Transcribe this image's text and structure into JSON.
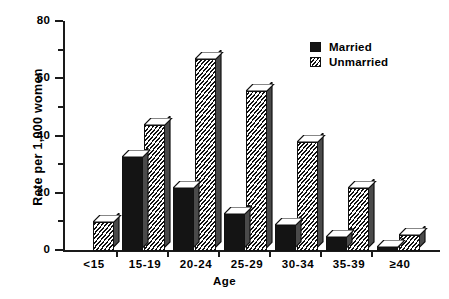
{
  "chart_data": {
    "type": "bar",
    "title": "",
    "xlabel": "Age",
    "ylabel": "Rate per 1,000 women",
    "categories": [
      "<15",
      "15-19",
      "20-24",
      "25-29",
      "30-34",
      "35-39",
      "≥40"
    ],
    "series": [
      {
        "name": "Married",
        "values": [
          0,
          33,
          22,
          13,
          9,
          5,
          1.5
        ]
      },
      {
        "name": "Unmarried",
        "values": [
          10,
          44,
          67,
          56,
          38,
          22,
          5.5
        ]
      }
    ],
    "ylim": [
      0,
      80
    ],
    "yticks": [
      0,
      20,
      40,
      60,
      80
    ],
    "ytick_labels": [
      "0",
      "20",
      "40",
      "60",
      "80"
    ],
    "yminor_ticks": [
      10,
      30,
      50,
      70
    ],
    "grid": false,
    "legend_position": "top-right",
    "style": "3d-bar",
    "colors": {
      "married": "#141414",
      "unmarried": "#ffffff",
      "axis": "#1a1a1a",
      "background": "#ffffff"
    }
  },
  "legend": {
    "entries": [
      {
        "label": "Married"
      },
      {
        "label": "Unmarried"
      }
    ]
  }
}
